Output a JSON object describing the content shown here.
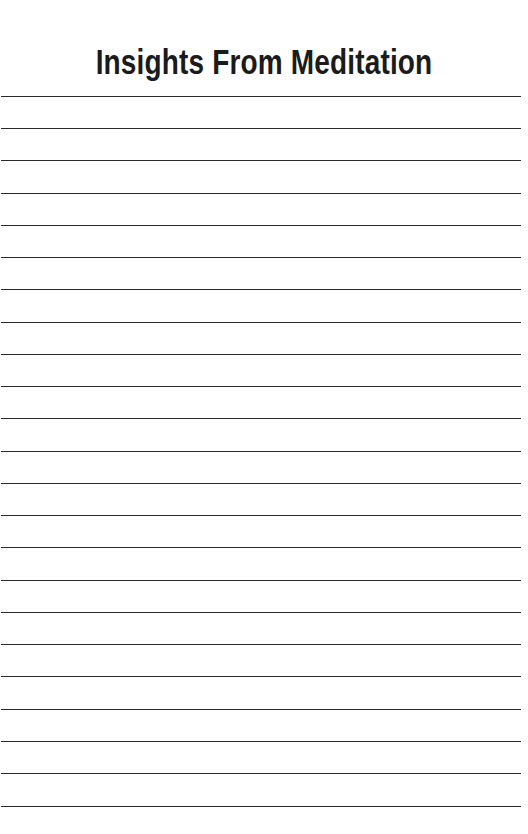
{
  "document": {
    "title": "Insights From Meditation",
    "page_background": "#ffffff",
    "title_color": "#1b1b1b"
  },
  "ruled_lines": {
    "count": 23,
    "color": "#2a2a2a",
    "thickness_px": 1.6,
    "first_line_y": 96,
    "spacing_px": 32.3,
    "left_x": 1,
    "width_px": 520,
    "y_positions": [
      96,
      128,
      160,
      193,
      225,
      257,
      289,
      322,
      354,
      386,
      418,
      451,
      483,
      515,
      547,
      580,
      612,
      644,
      676,
      709,
      741,
      773,
      806
    ]
  }
}
